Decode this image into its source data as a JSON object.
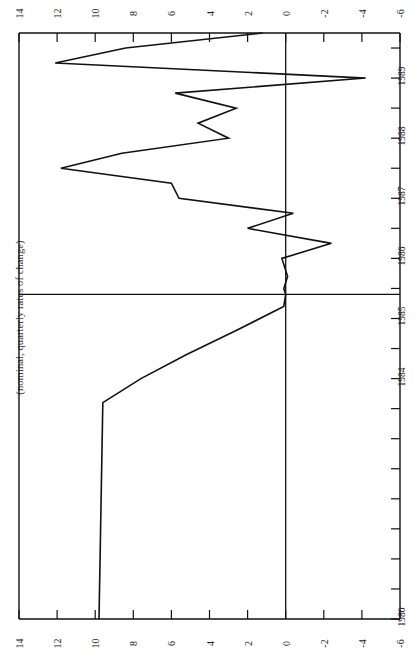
{
  "chart": {
    "caption": "(nominal, quarterly rates of change)",
    "orientation": "rotated-90-ccw",
    "value_axis": {
      "labels": [
        "14",
        "12",
        "10",
        "8",
        "6",
        "4",
        "2",
        "0",
        "-2",
        "-4",
        "-6"
      ],
      "min": -6,
      "max": 14
    },
    "time_axis": {
      "labels": [
        "1980",
        "1984",
        "1985",
        "1986",
        "1987",
        "1988",
        "1989"
      ]
    }
  },
  "chart_data": {
    "type": "line",
    "title": "",
    "subtitle": "(nominal, quarterly rates of change)",
    "xlabel": "",
    "ylabel": "",
    "grid": false,
    "legend": "none",
    "orientation": "horizontal-time-vertical-rotated",
    "xlim": [
      -6,
      14
    ],
    "ylim": [
      1980,
      1989.75
    ],
    "zero_line": 0,
    "separator_line_at": 1985.4,
    "categories": [
      "1980",
      "1983.6",
      "1984.0",
      "1984.4",
      "1984.8",
      "1985.2",
      "1985.4",
      "1985.5",
      "1985.7",
      "1986.0",
      "1986.25",
      "1986.5",
      "1986.75",
      "1987.0",
      "1987.25",
      "1987.5",
      "1987.75",
      "1988.0",
      "1988.25",
      "1988.5",
      "1988.75",
      "1989.0",
      "1989.25",
      "1989.5",
      "1989.75"
    ],
    "values": [
      9.8,
      9.6,
      7.6,
      5.2,
      2.6,
      0.1,
      0.0,
      0.1,
      -0.1,
      0.2,
      -2.4,
      2.0,
      -0.4,
      5.6,
      6.0,
      11.8,
      8.6,
      3.0,
      4.6,
      2.6,
      5.8,
      -4.2,
      12.1,
      8.4,
      1.2
    ],
    "series": [
      {
        "name": "quarterly rate of change",
        "values": [
          9.8,
          9.6,
          7.6,
          5.2,
          2.6,
          0.1,
          0.0,
          0.1,
          -0.1,
          0.2,
          -2.4,
          2.0,
          -0.4,
          5.6,
          6.0,
          11.8,
          8.6,
          3.0,
          4.6,
          2.6,
          5.8,
          -4.2,
          12.1,
          8.4,
          1.2
        ]
      }
    ]
  }
}
